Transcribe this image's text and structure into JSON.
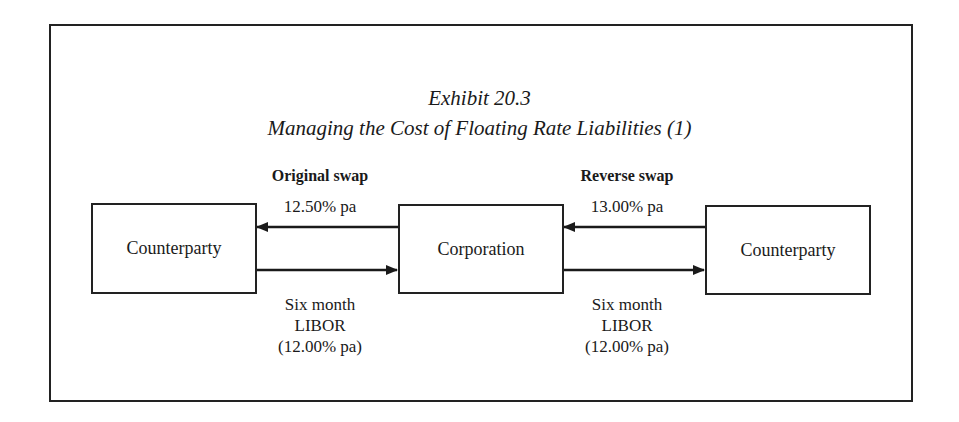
{
  "title": {
    "line1": "Exhibit 20.3",
    "line2": "Managing the Cost of Floating Rate Liabilities (1)"
  },
  "nodes": {
    "left": "Counterparty",
    "center": "Corporation",
    "right": "Counterparty"
  },
  "original_swap": {
    "heading": "Original swap",
    "fixed_rate": "12.50% pa",
    "floating_line1": "Six month",
    "floating_line2": "LIBOR",
    "floating_line3": "(12.00% pa)"
  },
  "reverse_swap": {
    "heading": "Reverse swap",
    "fixed_rate": "13.00% pa",
    "floating_line1": "Six month",
    "floating_line2": "LIBOR",
    "floating_line3": "(12.00% pa)"
  }
}
